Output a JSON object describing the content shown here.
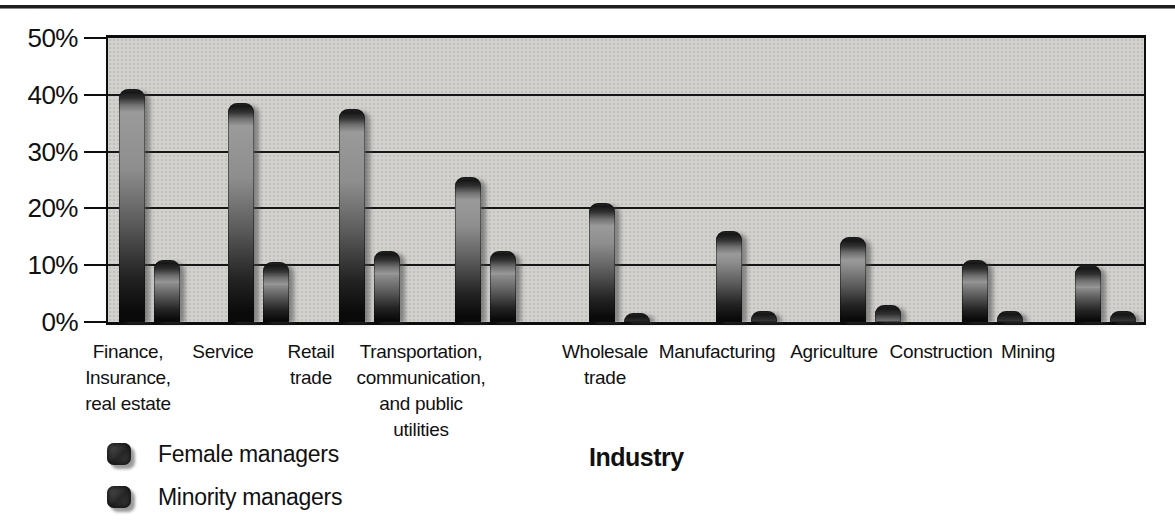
{
  "chart_data": {
    "type": "bar",
    "title": "",
    "xlabel": "Industry",
    "ylabel": "",
    "unit": "%",
    "ylim": [
      0,
      50
    ],
    "y_ticks": [
      "50%",
      "40%",
      "30%",
      "20%",
      "10%",
      "0%"
    ],
    "y_tick_values": [
      50,
      40,
      30,
      20,
      10,
      0
    ],
    "grid": "horizontal gridlines every 10%",
    "legend_position": "bottom-left",
    "categories": [
      "Finance, Insurance, real estate",
      "Service",
      "Retail trade",
      "Transportation, communication, and public utilities",
      "Wholesale trade",
      "Manufacturing",
      "Agriculture",
      "Construction",
      "Mining"
    ],
    "category_labels": [
      "Finance,\nInsurance,\nreal estate",
      "Service",
      "Retail\ntrade",
      "Transportation,\ncommunication,\nand public\nutilities",
      "Wholesale\ntrade",
      "Manufacturing",
      "Agriculture",
      "Construction",
      "Mining"
    ],
    "series": [
      {
        "name": "Female managers",
        "values": [
          41,
          38.5,
          37.5,
          25.5,
          21,
          16,
          15,
          11,
          10
        ]
      },
      {
        "name": "Minority managers",
        "values": [
          11,
          10.5,
          12.5,
          12.5,
          1.5,
          2,
          3,
          2,
          2
        ]
      }
    ]
  },
  "colors": {
    "page_background": "#ffffff",
    "plot_background": "#d2d1ce",
    "bar_dark": "#0a0a0a",
    "bar_highlight": "#9a9a9a",
    "frame": "#0d0d0d",
    "text": "#111111",
    "top_rule": "#1e1e1e"
  }
}
